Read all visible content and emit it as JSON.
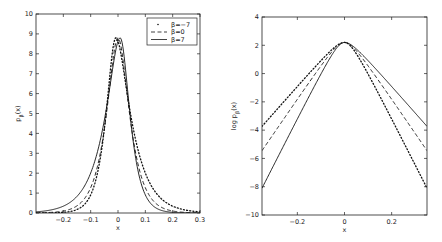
{
  "chart_data": [
    {
      "type": "line",
      "title": "",
      "xlabel": "x",
      "ylabel": "p_β(x)",
      "xlim": [
        -0.3,
        0.3
      ],
      "ylim": [
        0,
        10
      ],
      "xticks": [
        "-0.2",
        "-0.1",
        "0",
        "0.1",
        "0.2",
        "0.3"
      ],
      "yticks": [
        "0",
        "1",
        "2",
        "3",
        "4",
        "5",
        "6",
        "7",
        "8",
        "9",
        "10"
      ],
      "grid": false,
      "legend_position": "upper right",
      "x": [
        -0.3,
        -0.2,
        -0.15,
        -0.1,
        -0.075,
        -0.05,
        -0.025,
        0,
        0.025,
        0.05,
        0.075,
        0.1,
        0.15,
        0.2,
        0.3
      ],
      "series": [
        {
          "name": "β=−7",
          "style": "dotted",
          "values": [
            0.05,
            0.35,
            0.9,
            2.3,
            3.6,
            5.4,
            7.6,
            8.7,
            6.8,
            4.0,
            2.0,
            0.9,
            0.2,
            0.03,
            0.0
          ]
        },
        {
          "name": "β=0",
          "style": "dashed",
          "values": [
            0.03,
            0.25,
            0.6,
            1.5,
            2.6,
            4.3,
            7.0,
            8.8,
            7.0,
            4.3,
            2.6,
            1.5,
            0.6,
            0.25,
            0.03
          ]
        },
        {
          "name": "β=7",
          "style": "solid",
          "values": [
            0.0,
            0.03,
            0.2,
            0.9,
            2.0,
            4.0,
            6.8,
            8.7,
            7.6,
            5.4,
            3.6,
            2.3,
            0.9,
            0.35,
            0.05
          ]
        }
      ]
    },
    {
      "type": "line",
      "title": "",
      "xlabel": "x",
      "ylabel": "log p_β(x)",
      "xlim": [
        -0.35,
        0.35
      ],
      "ylim": [
        -10,
        4
      ],
      "xticks": [
        "-0.2",
        "0",
        "0.2"
      ],
      "yticks": [
        "-10",
        "-8",
        "-6",
        "-4",
        "-2",
        "0",
        "2",
        "4"
      ],
      "grid": false,
      "x": [
        -0.35,
        -0.2,
        -0.1,
        -0.05,
        0,
        0.05,
        0.1,
        0.2,
        0.35
      ],
      "series": [
        {
          "name": "β=−7",
          "style": "dotted",
          "values": [
            -4.5,
            -1.3,
            0.8,
            1.8,
            2.15,
            1.2,
            -0.6,
            -4.2,
            -9.5
          ]
        },
        {
          "name": "β=0",
          "style": "dashed",
          "values": [
            -6.4,
            -2.6,
            0.1,
            1.4,
            2.2,
            1.4,
            0.1,
            -2.6,
            -6.4
          ]
        },
        {
          "name": "β=7",
          "style": "solid",
          "values": [
            -9.5,
            -4.2,
            -0.6,
            1.2,
            2.15,
            1.8,
            0.8,
            -1.3,
            -4.5
          ]
        }
      ]
    }
  ],
  "legend": {
    "items": [
      {
        "label": "β=−7",
        "style": "dotted"
      },
      {
        "label": "β=0",
        "style": "dashed"
      },
      {
        "label": "β=7",
        "style": "solid"
      }
    ]
  },
  "left_plot": {
    "xlabel": "x",
    "ylabel": "p_β(x)",
    "xtick_labels": [
      "-0.2",
      "-0.1",
      "0",
      "0.1",
      "0.2",
      "0.3"
    ],
    "ytick_labels": [
      "0",
      "1",
      "2",
      "3",
      "4",
      "5",
      "6",
      "7",
      "8",
      "9",
      "10"
    ]
  },
  "right_plot": {
    "xlabel": "x",
    "ylabel": "log p_β(x)",
    "xtick_labels": [
      "-0.2",
      "0",
      "0.2"
    ],
    "ytick_labels": [
      "-10",
      "-8",
      "-6",
      "-4",
      "-2",
      "0",
      "2",
      "4"
    ]
  }
}
